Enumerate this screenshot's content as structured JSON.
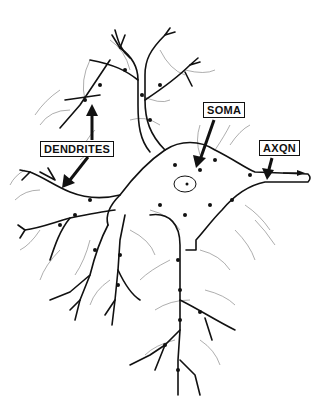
{
  "diagram": {
    "labels": {
      "dendrites": "DENDRITES",
      "soma": "SOMA",
      "axon": "AXQN"
    },
    "colors": {
      "ink": "#111111",
      "background": "#ffffff",
      "hair": "#777777"
    }
  }
}
